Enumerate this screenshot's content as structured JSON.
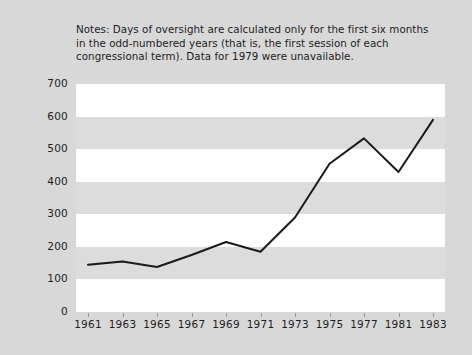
{
  "notes": {
    "text": "Notes: Days of oversight are calculated only for the first six months\nin the odd-numbered years (that is, the first session of each\ncongressional term). Data for 1979 were unavailable."
  },
  "colors": {
    "page_background": "#d8d8d8",
    "plot_background": "#ffffff",
    "band": "#dcdcdc",
    "line": "#1a1a1a",
    "text": "#1d1d1d"
  },
  "chart_data": {
    "type": "line",
    "title": "",
    "subtitle": "",
    "xlabel": "",
    "ylabel": "Days",
    "categories": [
      "1961",
      "1963",
      "1965",
      "1967",
      "1969",
      "1971",
      "1973",
      "1975",
      "1977",
      "1981",
      "1983"
    ],
    "values": [
      145,
      155,
      138,
      175,
      215,
      185,
      290,
      455,
      533,
      430,
      590
    ],
    "series": [
      {
        "name": "Days of oversight",
        "values": [
          145,
          155,
          138,
          175,
          215,
          185,
          290,
          455,
          533,
          430,
          590
        ]
      }
    ],
    "ylim": [
      0,
      700
    ],
    "yticks": [
      0,
      100,
      200,
      300,
      400,
      500,
      600,
      700
    ],
    "ytick_labels": [
      "0",
      "100",
      "200",
      "300",
      "400",
      "500",
      "600",
      "700"
    ],
    "xtick_labels": [
      "1961",
      "1963",
      "1965",
      "1967",
      "1969",
      "1971",
      "1973",
      "1975",
      "1977",
      "1981",
      "1983"
    ],
    "grid": false,
    "banded_background": true,
    "legend": null,
    "legend_position": "none",
    "annotations": [
      "Notes: Days of oversight are calculated only for the first six months in the odd-numbered years (that is, the first session of each congressional term). Data for 1979 were unavailable."
    ]
  }
}
